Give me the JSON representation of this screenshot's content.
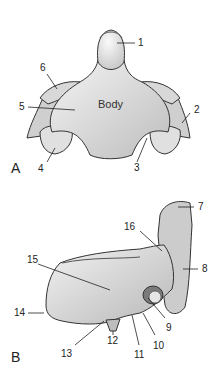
{
  "figure": {
    "panels": [
      {
        "letter": "A",
        "center_text": "Body",
        "labels": [
          "1",
          "2",
          "3",
          "4",
          "5",
          "6"
        ]
      },
      {
        "letter": "B",
        "labels": [
          "7",
          "8",
          "9",
          "10",
          "11",
          "12",
          "13",
          "14",
          "15",
          "16"
        ]
      }
    ]
  }
}
